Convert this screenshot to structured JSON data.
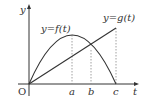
{
  "diagram": {
    "type": "function-graph",
    "axes": {
      "x_label": "t",
      "y_label": "y",
      "origin_label": "O"
    },
    "curves": [
      {
        "name": "f",
        "label": "y=f(t)",
        "kind": "parabola",
        "description": "concave-down curve from O through maximum at t=a back to t-axis at t=c"
      },
      {
        "name": "g",
        "label": "y=g(t)",
        "kind": "line",
        "description": "straight line from O rising to the right, ending above t=c"
      }
    ],
    "ticks": [
      {
        "label": "a",
        "note": "t-value of maximum of f"
      },
      {
        "label": "b",
        "note": "t-value where f and g intersect"
      },
      {
        "label": "c",
        "note": "t-value where f returns to 0"
      }
    ],
    "colors": {
      "stroke": "#333333",
      "dotted": "#888888",
      "background": "#ffffff"
    }
  }
}
